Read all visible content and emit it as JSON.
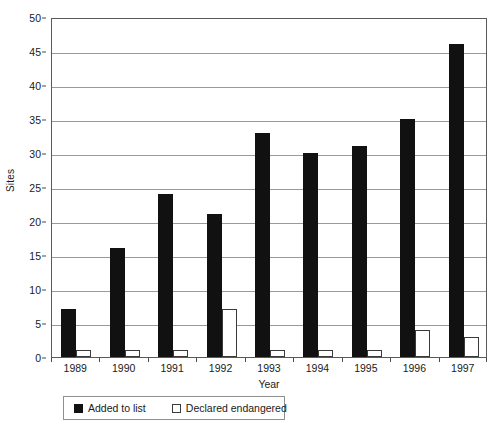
{
  "chart_data": {
    "type": "bar",
    "title": "",
    "xlabel": "Year",
    "ylabel": "Sites",
    "categories": [
      "1989",
      "1990",
      "1991",
      "1992",
      "1993",
      "1994",
      "1995",
      "1996",
      "1997"
    ],
    "series": [
      {
        "name": "Added to list",
        "color": "#111111",
        "values": [
          7,
          16,
          24,
          21,
          33,
          30,
          31,
          35,
          46
        ]
      },
      {
        "name": "Declared endangered",
        "color": "#ffffff",
        "values": [
          1,
          1,
          1,
          7,
          1,
          1,
          1,
          4,
          3
        ]
      }
    ],
    "ylim": [
      0,
      50
    ],
    "yticks": [
      0,
      5,
      10,
      15,
      20,
      25,
      30,
      35,
      40,
      45,
      50
    ],
    "ytick_labels": [
      "0",
      "5",
      "10",
      "15",
      "20",
      "25",
      "30",
      "35",
      "40",
      "45",
      "50"
    ],
    "grid": true,
    "grid_axis": "y",
    "legend_position": "bottom-left"
  },
  "legend": {
    "entries": [
      {
        "label": "Added to list",
        "swatch": "filled-black-square"
      },
      {
        "label": "Declared endangered",
        "swatch": "outlined-white-square"
      }
    ]
  },
  "colors": {
    "bar_added": "#111111",
    "bar_declared": "#ffffff",
    "bar_declared_border": "#3a3a3a",
    "gridline": "#9a9a9a",
    "axis": "#5a5a5a",
    "background": "#ffffff",
    "text": "#1a1a1a"
  }
}
